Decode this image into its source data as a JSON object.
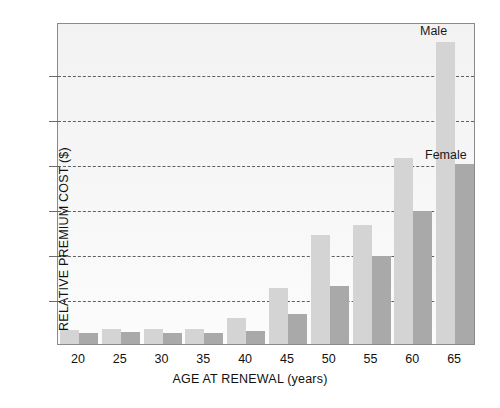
{
  "chart_data": {
    "type": "bar",
    "title": "",
    "xlabel": "AGE AT RENEWAL (years)",
    "ylabel": "RELATIVE PREMIUM COST ($)",
    "categories": [
      "20",
      "25",
      "30",
      "35",
      "40",
      "45",
      "50",
      "55",
      "60",
      "65"
    ],
    "series": [
      {
        "name": "Male",
        "color": "#d4d4d4",
        "values": [
          0.32,
          0.34,
          0.33,
          0.33,
          0.58,
          1.25,
          2.42,
          2.65,
          4.12,
          6.7
        ]
      },
      {
        "name": "Female",
        "color": "#a9a9a9",
        "values": [
          0.24,
          0.26,
          0.25,
          0.25,
          0.3,
          0.66,
          1.28,
          1.95,
          2.95,
          4.0
        ]
      }
    ],
    "ylim": [
      0,
      7.15
    ],
    "y_gridlines": [
      1,
      2,
      3,
      4,
      5,
      6
    ],
    "y_tick_labels": [],
    "grid": true,
    "legend": "annotations",
    "annotations": [
      {
        "text": "Male",
        "target": "65-male-bar"
      },
      {
        "text": "Female",
        "target": "65-female-bar"
      }
    ]
  },
  "axes": {
    "x_title": "AGE AT RENEWAL (years)",
    "y_title": "RELATIVE PREMIUM COST ($)"
  },
  "labels": {
    "male": "Male",
    "female": "Female"
  }
}
